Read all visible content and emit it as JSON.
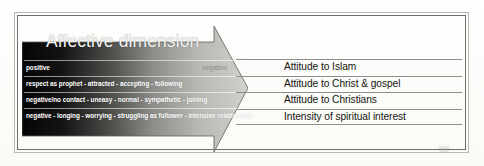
{
  "figure": {
    "title": "Affective dimension",
    "arrow_direction": "right",
    "colors": {
      "arrow_dark": "#0a0a0a",
      "arrow_light": "#cfcfcb",
      "title_text": "#f4f4f4",
      "label_text": "#15150f",
      "rule_line": "#8e8e8b",
      "frame_line": "#6f6f6c"
    }
  },
  "scale_rows": [
    {
      "text": "positive",
      "faint_text": "negative"
    },
    {
      "text": "respect as prophet - attracted - accepting - following",
      "faint_text": ""
    },
    {
      "text": "negative/no contact - uneasy - normal - sympathetic - joining",
      "faint_text": ""
    },
    {
      "text": "negative - longing - worrying - struggling as follower - intensive relationship",
      "faint_text": ""
    }
  ],
  "labels": [
    {
      "text": "Attitude to Islam"
    },
    {
      "text": "Attitude to Christ & gospel"
    },
    {
      "text": "Attitude to Christians"
    },
    {
      "text": "Intensity of spiritual interest"
    }
  ]
}
